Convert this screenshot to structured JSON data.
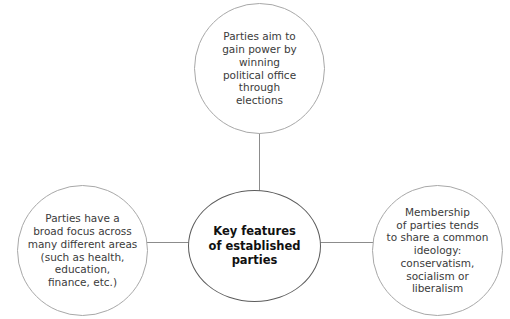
{
  "diagram": {
    "type": "hub-and-spoke",
    "center": {
      "id": "key-features",
      "text": "Key features\nof established\nparties"
    },
    "nodes": [
      {
        "id": "aim-for-power",
        "position": "top",
        "text": "Parties aim to\ngain power by winning\npolitical office\nthrough\nelections"
      },
      {
        "id": "broad-focus",
        "position": "left",
        "text": "Parties have a\nbroad focus across\nmany different areas\n(such as health,\neducation,\nfinance, etc.)"
      },
      {
        "id": "shared-ideology",
        "position": "right",
        "text": "Membership\nof parties tends\nto share a common\nideology: conservatism,\nsocialism or\nliberalism"
      }
    ],
    "connectors": [
      {
        "id": "top-to-center",
        "from": "aim-for-power",
        "to": "key-features",
        "orientation": "vertical"
      },
      {
        "id": "left-to-center",
        "from": "broad-focus",
        "to": "key-features",
        "orientation": "horizontal"
      },
      {
        "id": "right-to-center",
        "from": "shared-ideology",
        "to": "key-features",
        "orientation": "horizontal"
      }
    ],
    "colors": {
      "background": "#ffffff",
      "outer_stroke": "#a8a8a8",
      "center_stroke": "#5c5c5c",
      "connector": "#8c8c8c",
      "outer_text": "#3b3b3b",
      "center_text": "#111111"
    }
  }
}
